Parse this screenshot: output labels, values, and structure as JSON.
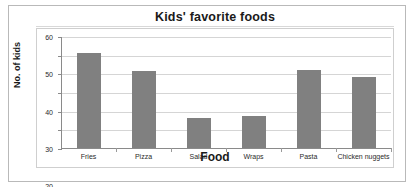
{
  "chart_data": {
    "type": "bar",
    "title": "Kids' favorite foods",
    "xlabel": "Food",
    "ylabel": "No. of kids",
    "categories": [
      "Fries",
      "Pizza",
      "Salad",
      "Wraps",
      "Pasta",
      "Chicken nuggets"
    ],
    "values": [
      51,
      41,
      16,
      17,
      42,
      38
    ],
    "ylim": [
      0,
      60
    ],
    "yticks": [
      0,
      10,
      20,
      30,
      40,
      50,
      60
    ],
    "ytick_labels": [
      "0",
      "10",
      "20",
      "30",
      "40",
      "50",
      "60"
    ],
    "grid": true,
    "legend": false,
    "bar_color": "#808080",
    "gridline_color": "#d5d5d5",
    "axis_color": "#8a8a8a",
    "text_color": "#2b2b2b"
  }
}
